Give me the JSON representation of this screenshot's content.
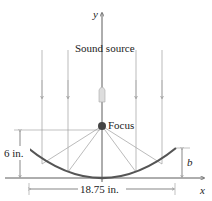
{
  "labels": {
    "y_axis": "y",
    "x_axis": "x",
    "source": "Sound source",
    "focus": "Focus",
    "height": "6 in.",
    "width": "18.75 in.",
    "b": "b"
  },
  "colors": {
    "ray": "#aaaaaa",
    "dish": "#555555",
    "axis": "#333333",
    "focus": "#444444"
  }
}
